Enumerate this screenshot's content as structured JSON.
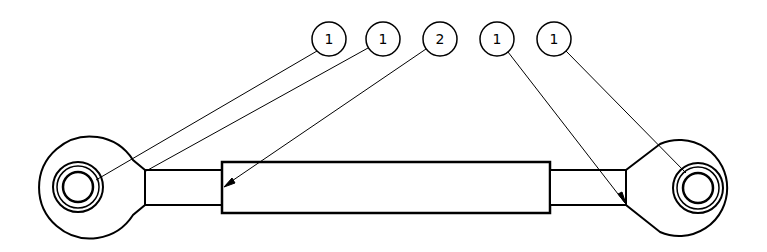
{
  "drawing": {
    "title": "Tie rod assembly drawing",
    "colors": {
      "line": "#000000",
      "background": "#ffffff"
    },
    "balloons": [
      {
        "label": "1",
        "cx": 329,
        "cy": 39,
        "target": [
          96,
          180
        ]
      },
      {
        "label": "1",
        "cx": 383,
        "cy": 39,
        "target": [
          146,
          171
        ]
      },
      {
        "label": "2",
        "cx": 440,
        "cy": 39,
        "target": [
          224,
          186
        ]
      },
      {
        "label": "1",
        "cx": 497,
        "cy": 39,
        "target": [
          625,
          203
        ]
      },
      {
        "label": "1",
        "cx": 554,
        "cy": 39,
        "target": [
          686,
          173
        ]
      }
    ],
    "parts": {
      "left_rod_end": "rod end eye (left)",
      "right_rod_end": "rod end eye (right)",
      "tube": "connecting tube"
    }
  }
}
